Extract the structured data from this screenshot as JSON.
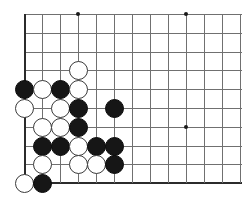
{
  "board": {
    "title": "Go board position",
    "game": "Go",
    "region": "lower-left corner",
    "line_color": "#707070",
    "edge_color": "#2b2b2b",
    "black_stone_color": "#161616",
    "white_stone_color": "#ffffff",
    "background_color": "#ffffff",
    "origin_x": 24,
    "origin_y": 14,
    "col_spacing": 18,
    "row_spacing": 18.8,
    "cols": 13,
    "rows": 10,
    "stone_diameter": 19,
    "visible_columns": [
      24,
      42,
      60,
      78,
      96,
      114,
      132,
      150,
      168,
      186,
      204,
      222,
      240
    ],
    "visible_rows": [
      14,
      33,
      52,
      70,
      89,
      108,
      127,
      146,
      164,
      183
    ],
    "edges": {
      "left_x": 24,
      "bottom_y": 183
    },
    "star_points": [
      {
        "name": "star-point-top-left",
        "x": 78,
        "y": 14
      },
      {
        "name": "star-point-top-right",
        "x": 186,
        "y": 14
      },
      {
        "name": "star-point-mid-right",
        "x": 186,
        "y": 127
      }
    ],
    "stones": [
      {
        "name": "stone-white-d4",
        "color": "white",
        "col": 4,
        "row": 4,
        "x": 78,
        "y": 70
      },
      {
        "name": "stone-black-a5",
        "color": "black",
        "col": 1,
        "row": 5,
        "x": 24,
        "y": 89
      },
      {
        "name": "stone-white-b5",
        "color": "white",
        "col": 2,
        "row": 5,
        "x": 42,
        "y": 89
      },
      {
        "name": "stone-black-c5",
        "color": "black",
        "col": 3,
        "row": 5,
        "x": 60,
        "y": 89
      },
      {
        "name": "stone-white-d5",
        "color": "white",
        "col": 4,
        "row": 5,
        "x": 78,
        "y": 89
      },
      {
        "name": "stone-white-a6",
        "color": "white",
        "col": 1,
        "row": 6,
        "x": 24,
        "y": 108
      },
      {
        "name": "stone-white-c6",
        "color": "white",
        "col": 3,
        "row": 6,
        "x": 60,
        "y": 108
      },
      {
        "name": "stone-black-d6",
        "color": "black",
        "col": 4,
        "row": 6,
        "x": 78,
        "y": 108
      },
      {
        "name": "stone-black-f6",
        "color": "black",
        "col": 6,
        "row": 6,
        "x": 114,
        "y": 108
      },
      {
        "name": "stone-white-b7",
        "color": "white",
        "col": 2,
        "row": 7,
        "x": 42,
        "y": 127
      },
      {
        "name": "stone-white-c7",
        "color": "white",
        "col": 3,
        "row": 7,
        "x": 60,
        "y": 127
      },
      {
        "name": "stone-black-d7",
        "color": "black",
        "col": 4,
        "row": 7,
        "x": 78,
        "y": 127
      },
      {
        "name": "stone-black-b8",
        "color": "black",
        "col": 2,
        "row": 8,
        "x": 42,
        "y": 146
      },
      {
        "name": "stone-black-c8",
        "color": "black",
        "col": 3,
        "row": 8,
        "x": 60,
        "y": 146
      },
      {
        "name": "stone-white-d8",
        "color": "white",
        "col": 4,
        "row": 8,
        "x": 78,
        "y": 146
      },
      {
        "name": "stone-black-e8",
        "color": "black",
        "col": 5,
        "row": 8,
        "x": 96,
        "y": 146
      },
      {
        "name": "stone-black-f8",
        "color": "black",
        "col": 6,
        "row": 8,
        "x": 114,
        "y": 146
      },
      {
        "name": "stone-white-b9",
        "color": "white",
        "col": 2,
        "row": 9,
        "x": 42,
        "y": 164
      },
      {
        "name": "stone-white-d9",
        "color": "white",
        "col": 4,
        "row": 9,
        "x": 78,
        "y": 164
      },
      {
        "name": "stone-white-e9",
        "color": "white",
        "col": 5,
        "row": 9,
        "x": 96,
        "y": 164
      },
      {
        "name": "stone-black-f9",
        "color": "black",
        "col": 6,
        "row": 9,
        "x": 114,
        "y": 164
      },
      {
        "name": "stone-white-a10",
        "color": "white",
        "col": 1,
        "row": 10,
        "x": 24,
        "y": 183
      },
      {
        "name": "stone-black-b10",
        "color": "black",
        "col": 2,
        "row": 10,
        "x": 42,
        "y": 183
      }
    ]
  }
}
